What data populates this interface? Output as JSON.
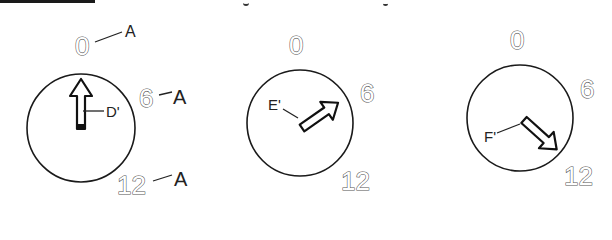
{
  "figure": {
    "header_fragment": "",
    "dials": [
      {
        "id": "dial-1",
        "scale_marks": {
          "top": "0",
          "right": "6",
          "bottom": "12"
        },
        "callouts": {
          "top": "A",
          "right": "A",
          "bottom": "A"
        },
        "pointer_label": "D'",
        "pointer_direction": "up (at 0)"
      },
      {
        "id": "dial-2",
        "scale_marks": {
          "top": "0",
          "right": "6",
          "bottom": "12"
        },
        "pointer_label": "E'",
        "pointer_direction": "upper-right (toward 6)"
      },
      {
        "id": "dial-3",
        "scale_marks": {
          "top": "0",
          "right": "6",
          "bottom": "12"
        },
        "pointer_label": "F'",
        "pointer_direction": "lower-right (toward 12)"
      }
    ]
  }
}
